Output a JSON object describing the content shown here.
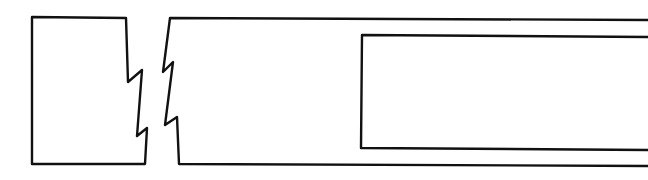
{
  "diagram": {
    "type": "broken-view line sketch",
    "background": "#ffffff",
    "stroke_color": "#111111",
    "stroke_width": 2.4,
    "shapes": {
      "left_block": {
        "points": "126,18 32,17 32,164 145,164 147,128 137,136 142,70 128,82 127,50 126,18"
      },
      "right_body": {
        "points": "648,20 170,18 163,72 173,62 165,125 177,117 179,164 648,166"
      },
      "inner_rect": {
        "points": "648,37 362,35 361,148 648,150"
      }
    }
  }
}
